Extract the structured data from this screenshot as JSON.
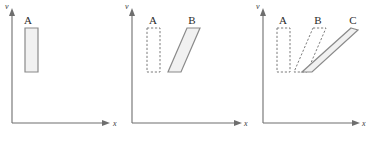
{
  "figure": {
    "type": "diagram",
    "panel_count": 3,
    "colors": {
      "axis": "#6e6e6e",
      "shape_stroke": "#8a8a8a",
      "shape_fill": "#f1f1f1",
      "dashed_stroke": "#7d7d7d",
      "label_text": "#2b2b2b",
      "background": "#ffffff"
    }
  },
  "panels": [
    {
      "id": "panel-1",
      "axes": {
        "y_label": "v",
        "x_label": "x"
      },
      "shapes": [
        {
          "id": "A",
          "label": "A",
          "style": "solid",
          "form": "rectangle"
        }
      ]
    },
    {
      "id": "panel-2",
      "axes": {
        "y_label": "v",
        "x_label": "x"
      },
      "shapes": [
        {
          "id": "A",
          "label": "A",
          "style": "dashed",
          "form": "rectangle"
        },
        {
          "id": "B",
          "label": "B",
          "style": "solid",
          "form": "parallelogram"
        }
      ]
    },
    {
      "id": "panel-3",
      "axes": {
        "y_label": "v",
        "x_label": "x"
      },
      "shapes": [
        {
          "id": "A",
          "label": "A",
          "style": "dashed",
          "form": "rectangle"
        },
        {
          "id": "B",
          "label": "B",
          "style": "dashed",
          "form": "parallelogram"
        },
        {
          "id": "C",
          "label": "C",
          "style": "solid",
          "form": "parallelogram"
        }
      ]
    }
  ]
}
